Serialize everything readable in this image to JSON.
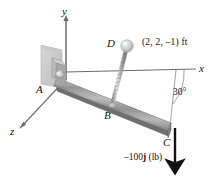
{
  "figure": {
    "type": "statics-free-body-diagram",
    "background_color": "#ffffff",
    "ink_color": "#111111",
    "beam_color": "#9a9a9a",
    "rod_color": "#b8b8b8",
    "wall_color": "#cfcfcf"
  },
  "axes": {
    "y_label": "y",
    "x_label": "x",
    "z_label": "z"
  },
  "points": {
    "a_label": "A",
    "b_label": "B",
    "c_label": "C",
    "d_label": "D"
  },
  "annotations": {
    "d_coordinates": "(2, 2, –1) ft",
    "angle": "30°",
    "load_prefix": "–100",
    "load_vector": "j",
    "load_units": " (lb)",
    "load_full": "–100j (lb)"
  }
}
